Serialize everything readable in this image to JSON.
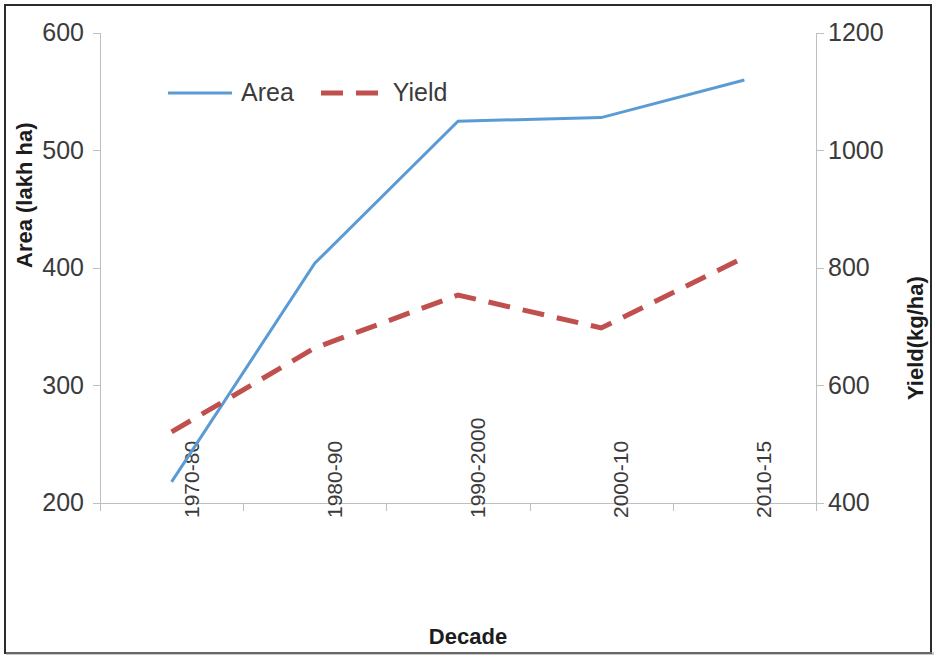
{
  "chart_data": {
    "type": "line",
    "title": "",
    "xlabel": "Decade",
    "categories": [
      "1970-80",
      "1980-90",
      "1990-2000",
      "2000-10",
      "2010-15"
    ],
    "grid": false,
    "legend_position": "top-left inside plot",
    "axes": {
      "left": {
        "label": "Area (lakh  ha)",
        "ticks": [
          200,
          300,
          400,
          500,
          600
        ],
        "ylim": [
          200,
          600
        ],
        "unit": "lakh ha"
      },
      "right": {
        "label": "Yield(kg/ha)",
        "ticks": [
          400,
          600,
          800,
          1000,
          1200
        ],
        "ylim": [
          400,
          1200
        ],
        "unit": "kg/ha"
      }
    },
    "series": [
      {
        "name": "Area",
        "axis": "left",
        "color": "#5b9bd5",
        "style": "solid",
        "width": 3,
        "values": [
          218,
          404,
          525,
          528,
          560
        ]
      },
      {
        "name": "Yield",
        "axis": "right",
        "color": "#c0504d",
        "style": "dashed",
        "width": 5,
        "values": [
          521,
          664,
          754,
          698,
          818
        ]
      }
    ]
  },
  "legend": {
    "items": [
      {
        "label": "Area"
      },
      {
        "label": "Yield"
      }
    ]
  },
  "colors": {
    "area_line": "#5b9bd5",
    "yield_line": "#c0504d",
    "axis": "#bfbfbf",
    "text": "#3b3b3b",
    "frame": "#2b2b2b"
  }
}
